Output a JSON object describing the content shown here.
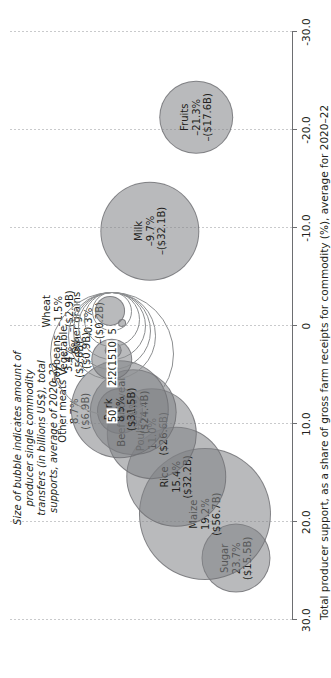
{
  "chart_data": {
    "type": "scatter",
    "title": "",
    "xlabel": "Total producer support, as a share of gross farm receipts for commodity (%), average for 2020–22",
    "ylabel": "",
    "xlim": [
      30.0,
      -30.0
    ],
    "xticks": [
      "30.0",
      "20.0",
      "10.0",
      "0",
      "-10.0",
      "-20.0",
      "-30.0"
    ],
    "xtick_values": [
      30,
      20,
      10,
      0,
      -10,
      -20,
      -30
    ],
    "grid": true,
    "legend_position": "top-center",
    "size_legend": {
      "caption": "Size of bubble indicates amount of producer single commodity transfers (in billions US$), total supports, average of 2020–22",
      "values": [
        "50",
        "25",
        "20",
        "15",
        "10",
        "5"
      ],
      "numeric": [
        50,
        25,
        20,
        15,
        10,
        5
      ]
    },
    "points": [
      {
        "name": "Sugar",
        "pct": 23.7,
        "pct_label": "23.7%",
        "value": 15.5,
        "value_label": "($15.5B)"
      },
      {
        "name": "Maize",
        "pct": 19.2,
        "pct_label": "19.2%",
        "value": 56.7,
        "value_label": "($56.7B)"
      },
      {
        "name": "Rice",
        "pct": 15.4,
        "pct_label": "15.4%",
        "value": 32.2,
        "value_label": "($32.2B)"
      },
      {
        "name": "Poultry",
        "pct": 11.0,
        "pct_label": "11.0%",
        "value": 26.6,
        "value_label": "($26.6B)"
      },
      {
        "name": "Beef and veal",
        "pct": 8.8,
        "pct_label": "8.8%",
        "value": 24.4,
        "value_label": "($24.4B)"
      },
      {
        "name": "Other meats",
        "pct": 8.7,
        "pct_label": "8.7%",
        "value": 6.9,
        "value_label": "($6.9B)"
      },
      {
        "name": "Pork",
        "pct": 8.5,
        "pct_label": "8.5%",
        "value": 31.5,
        "value_label": "($31.5B)"
      },
      {
        "name": "Soybeans",
        "pct": 3.4,
        "pct_label": "3.4%",
        "value": 5.6,
        "value_label": "($5.6B)"
      },
      {
        "name": "Vegetable",
        "pct": 2.5,
        "pct_label": "2.5%",
        "value": 0.9,
        "value_label": "($0.9B)"
      },
      {
        "name": "Other grains",
        "pct": -0.3,
        "pct_label": "–0.3%",
        "value": 0.2,
        "value_label": "–($0.2B)"
      },
      {
        "name": "Wheat",
        "pct": -1.5,
        "pct_label": "–1.5%",
        "value": 2.9,
        "value_label": "–($2.9B)"
      },
      {
        "name": "Milk",
        "pct": -9.7,
        "pct_label": "–9.7%",
        "value": 32.1,
        "value_label": "–($32.1B)"
      },
      {
        "name": "Fruits",
        "pct": -21.3,
        "pct_label": "–21.3%",
        "value": 17.6,
        "value_label": "–($17.6B)"
      }
    ]
  },
  "colors": {
    "bubble_fill": "#808285",
    "bubble_stroke": "#6d6e71",
    "axis": "#6d6e71",
    "grid": "#c9cacc",
    "text": "#231f20"
  }
}
